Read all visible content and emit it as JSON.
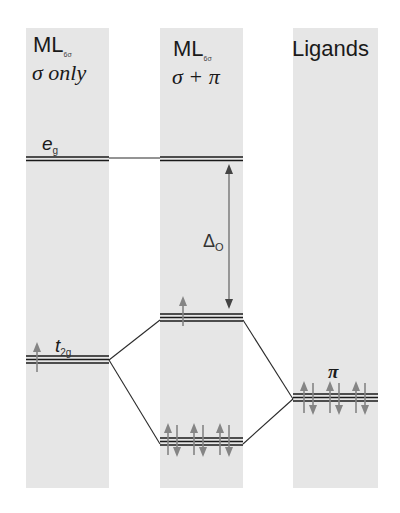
{
  "diagram": {
    "colors": {
      "column_bg": "#e6e6e6",
      "level_line": "#1a1a1a",
      "electron_arrow": "#858585"
    },
    "columns": [
      {
        "id": "sigma-only",
        "header_main": "ML",
        "header_sub": "6σ",
        "header_line2": "σ only",
        "x": 26,
        "width": 83
      },
      {
        "id": "sigma-pi",
        "header_main": "ML",
        "header_sub": "6σ",
        "header_line2": "σ + π",
        "x": 160,
        "width": 83
      },
      {
        "id": "ligands",
        "header_main": "Ligands",
        "header_sub": "",
        "header_line2": "",
        "x": 293,
        "width": 85
      }
    ],
    "levels": [
      {
        "id": "eg-sigma-only",
        "column": 0,
        "label": "e",
        "label_sub": "g",
        "y": 157,
        "degeneracy": 2
      },
      {
        "id": "eg-sigma-pi",
        "column": 1,
        "label": "",
        "label_sub": "",
        "y": 157,
        "degeneracy": 2
      },
      {
        "id": "t2g-sigma-only",
        "column": 0,
        "label": "t",
        "label_sub": "2g",
        "y": 355,
        "degeneracy": 3,
        "electrons": "1 up"
      },
      {
        "id": "t2g-antibonding",
        "column": 1,
        "label": "",
        "label_sub": "",
        "y": 313,
        "degeneracy": 3,
        "electrons": "1 up"
      },
      {
        "id": "t2g-bonding",
        "column": 1,
        "label": "",
        "label_sub": "",
        "y": 437,
        "degeneracy": 3,
        "electrons": "3 pairs"
      },
      {
        "id": "ligand-pi",
        "column": 2,
        "label": "π",
        "label_sub": "",
        "y": 393,
        "degeneracy": 3,
        "electrons": "3 pairs"
      }
    ],
    "splitting": {
      "label": "Δ",
      "label_sub": "O"
    }
  }
}
